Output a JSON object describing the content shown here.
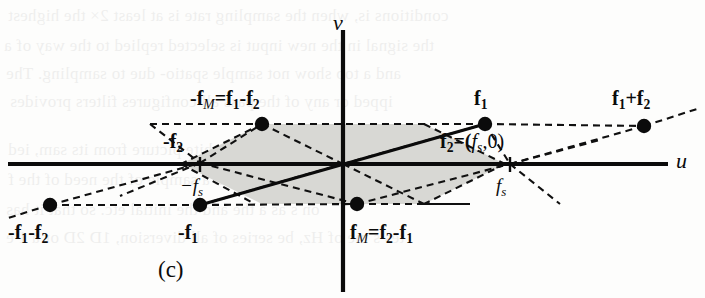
{
  "figure": {
    "caption": "(c)",
    "axes": {
      "x_label": "u",
      "y_label": "v"
    },
    "ticks": [
      {
        "name": "fs-positive",
        "text": "fs",
        "x": 510,
        "y": 196
      },
      {
        "name": "fs-negative",
        "text": "-fs",
        "x": 190,
        "y": 196
      }
    ],
    "points": [
      {
        "name": "minus-fM",
        "label": "-fM = f1-f2",
        "x": 262,
        "y": 124
      },
      {
        "name": "f1",
        "label": "f1",
        "x": 485,
        "y": 124
      },
      {
        "name": "f1-plus-f2",
        "label": "f1+f2",
        "x": 644,
        "y": 126
      },
      {
        "name": "minus-f2",
        "label": "-f2",
        "x": 200,
        "y": 163
      },
      {
        "name": "f2",
        "label": "f2 = (fs,0)",
        "x": 510,
        "y": 164
      },
      {
        "name": "minus-f1-minus-f2",
        "label": "-f1-f2",
        "x": 50,
        "y": 205
      },
      {
        "name": "minus-f1",
        "label": "-f1",
        "x": 200,
        "y": 205
      },
      {
        "name": "fM",
        "label": "fM = f2-f1",
        "x": 357,
        "y": 204
      }
    ],
    "labels": {
      "minus_fM": {
        "lead": "-f",
        "sub": "M",
        "eq": "=f",
        "s1": "1",
        "minus": "-f",
        "s2": "2"
      },
      "f1": {
        "lead": "f",
        "sub": "1"
      },
      "f1_plus_f2": {
        "lead": "f",
        "s1": "1",
        "plus": "+f",
        "s2": "2"
      },
      "minus_f2": {
        "lead": "-f",
        "sub": "2"
      },
      "f2_eq": {
        "lead": "f",
        "sub": "2",
        "eq": "=(",
        "fs": "f",
        "fssub": "s",
        "rest": ",0)"
      },
      "minus_f1_minus_f2": {
        "lead": "-f",
        "s1": "1",
        "minus": "-f",
        "s2": "2"
      },
      "minus_f1": {
        "lead": "-f",
        "sub": "1"
      },
      "fM_eq": {
        "lead": "f",
        "sub": "M",
        "eq": "=f",
        "s1": "2",
        "minus": "-f",
        "s2": "1"
      }
    },
    "colors": {
      "ink": "#0b0b0b",
      "shade": "#d8d8d4",
      "paper": "#fdfdfc"
    },
    "ghost_text": [
      {
        "text": "conditions is, when the sampling rate is at least 2× the highest",
        "x": 8,
        "y": 6
      },
      {
        "text": "the signal in the new input is selected   replied to the way of a",
        "x": 4,
        "y": 36
      },
      {
        "text": "and   a top show not sample spatio-    due to sampling. The",
        "x": 6,
        "y": 64
      },
      {
        "text": "ipped or any   of  the pass  all  configures filters  provides",
        "x": 10,
        "y": 92
      },
      {
        "text": "luminance  of  a black and white picture from its sam, ied",
        "x": 8,
        "y": 140
      },
      {
        "text": "so as in a ffected, in a   sample of the   need of the f",
        "x": 8,
        "y": 170
      },
      {
        "text": "on s as a   the and the initial etc. so that it has",
        "x": 6,
        "y": 200
      },
      {
        "text": "tes s me of   Hz, be series of all diversion, 1D  2D or a 1 e",
        "x": 6,
        "y": 228
      }
    ]
  }
}
